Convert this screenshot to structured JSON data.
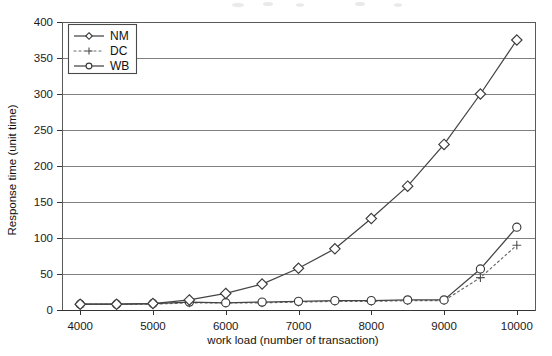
{
  "chart_data": {
    "type": "line",
    "title": "",
    "xlabel": "work load (number of transaction)",
    "ylabel": "Response time (unit time)",
    "x": [
      4000,
      4500,
      5000,
      5500,
      6000,
      6500,
      7000,
      7500,
      8000,
      8500,
      9000,
      9500,
      10000
    ],
    "xlim": [
      3750,
      10250
    ],
    "ylim": [
      0,
      400
    ],
    "xticks": [
      4000,
      5000,
      6000,
      7000,
      8000,
      9000,
      10000
    ],
    "xticklabels": [
      "4000",
      "5000",
      "6000",
      "7000",
      "8000",
      "9000",
      "10000"
    ],
    "yticks": [
      0,
      50,
      100,
      150,
      200,
      250,
      300,
      350,
      400
    ],
    "yticklabels": [
      "0",
      "50",
      "100",
      "150",
      "200",
      "250",
      "300",
      "350",
      "400"
    ],
    "grid": "horizontal",
    "legend_position": "upper-left-inside",
    "series": [
      {
        "name": "NM",
        "marker": "diamond",
        "linestyle": "solid",
        "color": "#444444",
        "values": [
          8,
          8,
          9,
          14,
          23,
          36,
          58,
          85,
          127,
          172,
          230,
          300,
          375
        ]
      },
      {
        "name": "DC",
        "marker": "plus",
        "linestyle": "dotted",
        "color": "#6d6d6d",
        "values": [
          8,
          8,
          8,
          10,
          10,
          10,
          11,
          12,
          12,
          13,
          13,
          45,
          90
        ]
      },
      {
        "name": "WB",
        "marker": "circle",
        "linestyle": "solid",
        "color": "#555555",
        "values": [
          8,
          8,
          9,
          11,
          10,
          11,
          12,
          13,
          13,
          14,
          14,
          57,
          115
        ]
      }
    ]
  },
  "legend": {
    "entries": [
      {
        "label": "NM"
      },
      {
        "label": "DC"
      },
      {
        "label": "WB"
      }
    ]
  }
}
